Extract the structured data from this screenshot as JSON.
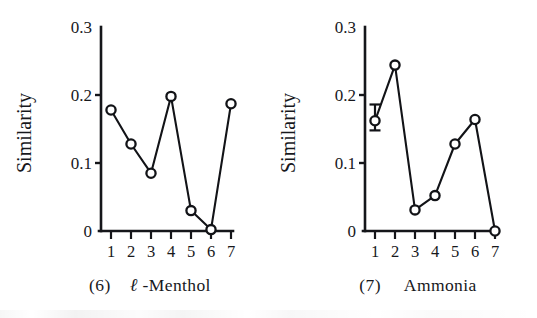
{
  "figure": {
    "background": "#ffffff",
    "ink_color": "#121317",
    "panel_count": 2
  },
  "panels": [
    {
      "id": "panel-6-l-menthol",
      "caption_number": "(6)",
      "caption_name": "ℓ-Menthol",
      "caption_prefix_italic": "ℓ",
      "caption_suffix": "-Menthol",
      "chart_data": {
        "type": "line",
        "title": "(6)  ℓ-Menthol",
        "xlabel": "",
        "ylabel": "Similarity",
        "categories": [
          "1",
          "2",
          "3",
          "4",
          "5",
          "6",
          "7"
        ],
        "x": [
          1,
          2,
          3,
          4,
          5,
          6,
          7
        ],
        "values": [
          0.178,
          0.128,
          0.085,
          0.198,
          0.03,
          0.002,
          0.187
        ],
        "ylim": [
          0,
          0.3
        ],
        "yticks": [
          0,
          0.1,
          0.2,
          0.3
        ],
        "ytick_labels": [
          "0",
          "0.1",
          "0.2",
          "0.3"
        ],
        "xlim": [
          0.5,
          7.5
        ],
        "xticks": [
          1,
          2,
          3,
          4,
          5,
          6,
          7
        ],
        "xtick_labels": [
          "1",
          "2",
          "3",
          "4",
          "5",
          "6",
          "7"
        ],
        "grid": false,
        "legend": null,
        "markers": "open-circle",
        "error_bars": []
      }
    },
    {
      "id": "panel-7-ammonia",
      "caption_number": "(7)",
      "caption_name": "Ammonia",
      "caption_prefix_italic": "",
      "caption_suffix": "Ammonia",
      "chart_data": {
        "type": "line",
        "title": "(7)  Ammonia",
        "xlabel": "",
        "ylabel": "Similarity",
        "categories": [
          "1",
          "2",
          "3",
          "4",
          "5",
          "6",
          "7"
        ],
        "x": [
          1,
          2,
          3,
          4,
          5,
          6,
          7
        ],
        "values": [
          0.162,
          0.244,
          0.031,
          0.052,
          0.128,
          0.164,
          0.0
        ],
        "ylim": [
          0,
          0.3
        ],
        "yticks": [
          0,
          0.1,
          0.2,
          0.3
        ],
        "ytick_labels": [
          "0",
          "0.1",
          "0.2",
          "0.3"
        ],
        "xlim": [
          0.5,
          7.5
        ],
        "xticks": [
          1,
          2,
          3,
          4,
          5,
          6,
          7
        ],
        "xtick_labels": [
          "1",
          "2",
          "3",
          "4",
          "5",
          "6",
          "7"
        ],
        "grid": false,
        "legend": null,
        "markers": "open-circle",
        "error_bars": [
          {
            "x": 1,
            "y": 0.162,
            "low": 0.148,
            "high": 0.186
          }
        ]
      }
    }
  ]
}
